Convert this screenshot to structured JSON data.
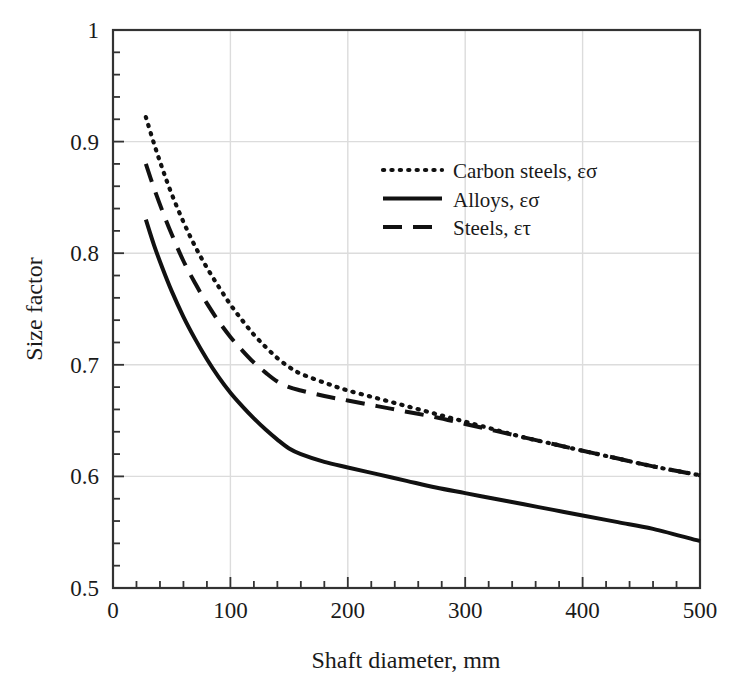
{
  "chart_data": {
    "type": "line",
    "title": "",
    "xlabel": "Shaft diameter, mm",
    "ylabel": "Size factor",
    "xlim": [
      0,
      500
    ],
    "ylim": [
      0.5,
      1
    ],
    "grid": true,
    "legend_position": "upper-center-right",
    "x_ticks": [
      "0",
      "100",
      "200",
      "300",
      "400",
      "500"
    ],
    "x_tick_values": [
      0,
      100,
      200,
      300,
      400,
      500
    ],
    "x_minor_tick_step": 20,
    "y_ticks": [
      "0.5",
      "0.6",
      "0.7",
      "0.8",
      "0.9",
      "1"
    ],
    "y_tick_values": [
      0.5,
      0.6,
      0.7,
      0.8,
      0.9,
      1
    ],
    "y_minor_tick_step": 0.02,
    "series": [
      {
        "name": "Carbon steels, εσ",
        "style": "dotted",
        "color": "#111111",
        "x": [
          28,
          35,
          42,
          50,
          60,
          70,
          80,
          90,
          100,
          110,
          120,
          130,
          140,
          150,
          160,
          180,
          200,
          225,
          250,
          275,
          300,
          325,
          350,
          375,
          400,
          430,
          460,
          500
        ],
        "y": [
          0.922,
          0.898,
          0.876,
          0.853,
          0.828,
          0.806,
          0.787,
          0.77,
          0.754,
          0.74,
          0.727,
          0.716,
          0.706,
          0.698,
          0.692,
          0.684,
          0.677,
          0.67,
          0.663,
          0.656,
          0.649,
          0.642,
          0.635,
          0.629,
          0.623,
          0.616,
          0.609,
          0.601
        ]
      },
      {
        "name": "Alloys, εσ",
        "style": "solid",
        "color": "#111111",
        "x": [
          28,
          35,
          42,
          50,
          60,
          70,
          80,
          90,
          100,
          110,
          120,
          130,
          140,
          150,
          160,
          180,
          200,
          225,
          250,
          275,
          300,
          325,
          350,
          375,
          400,
          430,
          460,
          500
        ],
        "y": [
          0.83,
          0.807,
          0.787,
          0.766,
          0.743,
          0.723,
          0.705,
          0.689,
          0.675,
          0.663,
          0.652,
          0.642,
          0.633,
          0.625,
          0.62,
          0.613,
          0.608,
          0.602,
          0.596,
          0.59,
          0.585,
          0.58,
          0.575,
          0.57,
          0.565,
          0.559,
          0.553,
          0.542
        ]
      },
      {
        "name": "Steels, ετ",
        "style": "dashed",
        "color": "#111111",
        "x": [
          28,
          35,
          42,
          50,
          60,
          70,
          80,
          90,
          100,
          110,
          120,
          130,
          140,
          150,
          160,
          180,
          200,
          225,
          250,
          275,
          300,
          325,
          350,
          375,
          400,
          430,
          460,
          500
        ],
        "y": [
          0.88,
          0.858,
          0.838,
          0.817,
          0.793,
          0.773,
          0.755,
          0.739,
          0.725,
          0.713,
          0.702,
          0.693,
          0.685,
          0.68,
          0.677,
          0.672,
          0.668,
          0.663,
          0.658,
          0.653,
          0.647,
          0.641,
          0.635,
          0.629,
          0.623,
          0.616,
          0.609,
          0.601
        ]
      }
    ]
  },
  "axes": {
    "x_title": "Shaft diameter, mm",
    "y_title": "Size factor"
  },
  "legend": {
    "entries": [
      {
        "label": "Carbon steels, εσ",
        "style": "dotted"
      },
      {
        "label": "Alloys, εσ",
        "style": "solid"
      },
      {
        "label": "Steels, ετ",
        "style": "dashed"
      }
    ]
  },
  "colors": {
    "line": "#111111",
    "axis": "#333333",
    "grid": "#dcdcdc",
    "background": "#ffffff"
  }
}
